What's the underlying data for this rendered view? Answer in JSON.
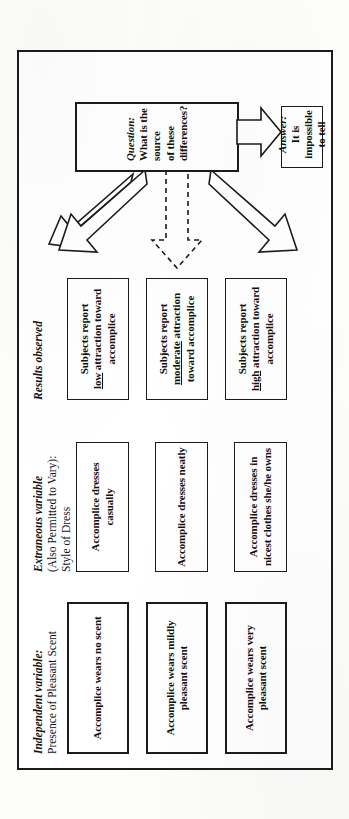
{
  "figure": {
    "headings": {
      "independent": {
        "italic": "Independent variable:",
        "rest": "Presence of Pleasant Scent"
      },
      "extraneous": {
        "italic": "Extraneous variable",
        "line2": "(Also Permitted to Vary):",
        "line3": "Style of Dress"
      },
      "results": {
        "italic": "Results observed"
      }
    },
    "independent_boxes": [
      {
        "text": "Accomplice wears no scent"
      },
      {
        "text": "Accomplice wears mildly pleasant scent"
      },
      {
        "text": "Accomplice wears very pleasant scent"
      }
    ],
    "extraneous_boxes": [
      {
        "text": "Accomplice dresses casually"
      },
      {
        "text": "Accomplice dresses neatly"
      },
      {
        "text": "Accomplice dresses in nicest clothes she/he owns"
      }
    ],
    "results_boxes": [
      {
        "pre": "Subjects report",
        "emphasis": "low",
        "post": "attraction toward accomplice"
      },
      {
        "pre": "Subjects report",
        "emphasis": "moderate",
        "post": "attraction toward accomplice"
      },
      {
        "pre": "Subjects report",
        "emphasis": "high",
        "post": "attraction toward accomplice"
      }
    ],
    "question": {
      "label": "Question:",
      "line1": "What is the source",
      "line2": "of these differences?"
    },
    "answer": {
      "label": "Answer:",
      "line1": "It is impossible",
      "line2": "to tell"
    },
    "colors": {
      "ink": "#1b1b1b",
      "paper": "#ffffff"
    }
  }
}
